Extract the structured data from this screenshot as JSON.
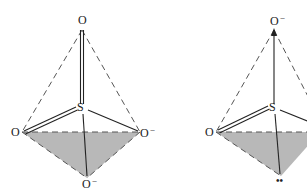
{
  "diagrams": [
    {
      "name": "sulfate-tetrahedron",
      "atoms": {
        "top": {
          "label": "O",
          "charge": ""
        },
        "center": {
          "label": "S",
          "charge": ""
        },
        "left": {
          "label": "O",
          "charge": ""
        },
        "right": {
          "label": "O",
          "charge": "−"
        },
        "bottom": {
          "label": "O",
          "charge": "−"
        }
      }
    },
    {
      "name": "sulfite-tetrahedron",
      "atoms": {
        "top": {
          "label": "O",
          "charge": "−"
        },
        "center": {
          "label": "S",
          "charge": ""
        },
        "left": {
          "label": "O",
          "charge": ""
        },
        "bottom": {
          "label": "••",
          "charge": ""
        }
      }
    }
  ],
  "colors": {
    "face_fill": "#b8b8b8",
    "line": "#222222",
    "dash": "#555555"
  }
}
